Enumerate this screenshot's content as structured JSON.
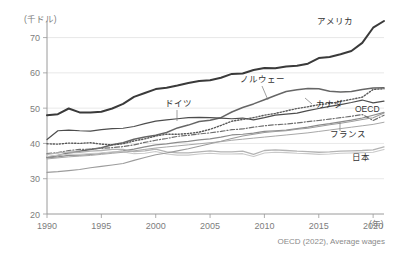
{
  "chart_data": {
    "type": "line",
    "title": "",
    "subtitle": "",
    "xlabel": "(年)",
    "ylabel": "(千ドル)",
    "xlim": [
      1990,
      2021
    ],
    "ylim": [
      20,
      73
    ],
    "grid": "horizontal",
    "legend_position": "inline-labels",
    "source": "OECD (2022), Average wages",
    "x": [
      1990,
      1991,
      1992,
      1993,
      1994,
      1995,
      1996,
      1997,
      1998,
      1999,
      2000,
      2001,
      2002,
      2003,
      2004,
      2005,
      2006,
      2007,
      2008,
      2009,
      2010,
      2011,
      2012,
      2013,
      2014,
      2015,
      2016,
      2017,
      2018,
      2019,
      2020,
      2021
    ],
    "xticks": [
      1990,
      1995,
      2000,
      2005,
      2010,
      2015,
      2020
    ],
    "yticks": [
      20,
      30,
      40,
      50,
      60,
      70
    ],
    "series": [
      {
        "name": "アメリカ",
        "label": "アメリカ",
        "color": "#3a3a3a",
        "style": "solid",
        "width": 2.0,
        "values": [
          48.0,
          48.3,
          49.9,
          48.8,
          48.8,
          49.0,
          49.9,
          51.2,
          53.2,
          54.3,
          55.4,
          55.8,
          56.4,
          57.1,
          57.7,
          57.9,
          58.6,
          59.7,
          59.8,
          60.8,
          61.4,
          61.3,
          61.8,
          62.0,
          62.6,
          64.2,
          64.5,
          65.3,
          66.2,
          68.5,
          72.8,
          74.7
        ]
      },
      {
        "name": "ノルウェー",
        "label": "ノルウェー",
        "color": "#666666",
        "style": "solid",
        "width": 1.5,
        "values": [
          36.1,
          36.6,
          37.3,
          37.8,
          38.3,
          38.8,
          39.6,
          40.2,
          41.2,
          41.8,
          42.3,
          43.1,
          44.4,
          45.2,
          46.2,
          46.6,
          47.3,
          48.9,
          50.2,
          51.2,
          52.4,
          53.6,
          54.7,
          55.2,
          55.6,
          55.5,
          54.8,
          54.6,
          54.7,
          55.3,
          55.7,
          55.8
        ]
      },
      {
        "name": "ドイツ",
        "label": "ドイツ",
        "color": "#4d4d4d",
        "style": "solid",
        "width": 1.2,
        "values": [
          41.1,
          43.6,
          43.8,
          43.6,
          43.5,
          43.9,
          44.2,
          44.3,
          44.8,
          45.6,
          46.3,
          46.7,
          47.0,
          47.3,
          47.4,
          47.3,
          47.2,
          47.0,
          47.2,
          46.7,
          47.3,
          48.0,
          48.3,
          48.6,
          49.3,
          49.9,
          50.5,
          51.0,
          51.6,
          52.3,
          51.5,
          52.0
        ]
      },
      {
        "name": "カナダ",
        "label": "カナダ",
        "color": "#595959",
        "style": "dotted",
        "width": 1.4,
        "values": [
          39.9,
          39.8,
          40.1,
          40.0,
          40.2,
          39.8,
          39.6,
          39.9,
          40.7,
          41.3,
          42.1,
          42.6,
          42.6,
          42.8,
          43.2,
          44.0,
          45.1,
          46.3,
          46.8,
          47.3,
          48.0,
          48.5,
          49.2,
          49.9,
          50.4,
          51.0,
          51.3,
          51.9,
          52.5,
          53.1,
          55.3,
          55.5
        ]
      },
      {
        "name": "OECD",
        "label": "OECD",
        "color": "#8c8c8c",
        "style": "solid",
        "width": 1.2,
        "values": [
          35.9,
          36.2,
          36.6,
          36.7,
          36.9,
          37.2,
          37.5,
          37.9,
          38.4,
          39.0,
          39.6,
          39.9,
          40.3,
          40.6,
          41.0,
          41.3,
          41.8,
          42.4,
          42.6,
          42.9,
          43.4,
          43.6,
          43.8,
          44.2,
          44.6,
          45.2,
          45.6,
          46.1,
          46.6,
          47.2,
          48.0,
          48.8
        ]
      },
      {
        "name": "フランス",
        "label": "フランス",
        "color": "#6e6e6e",
        "style": "dashdot",
        "width": 1.2,
        "values": [
          37.1,
          37.4,
          38.0,
          38.3,
          38.4,
          38.6,
          38.8,
          39.1,
          39.6,
          40.3,
          40.9,
          41.4,
          42.0,
          42.3,
          42.7,
          43.0,
          43.4,
          43.9,
          44.1,
          44.6,
          45.0,
          45.3,
          45.5,
          45.8,
          46.2,
          46.5,
          46.9,
          47.3,
          47.7,
          48.2,
          46.5,
          48.0
        ]
      },
      {
        "name": "日本",
        "label": "日本",
        "color": "#b3b3b3",
        "style": "solid",
        "width": 1.3,
        "values": [
          36.9,
          37.3,
          37.6,
          37.5,
          37.8,
          38.0,
          38.3,
          38.3,
          37.7,
          37.9,
          38.4,
          37.6,
          37.3,
          37.3,
          37.6,
          37.9,
          37.6,
          37.6,
          37.8,
          36.9,
          38.0,
          38.2,
          38.0,
          37.8,
          37.7,
          37.5,
          37.6,
          37.8,
          37.9,
          38.0,
          38.2,
          39.0
        ]
      },
      {
        "name": "日本-下",
        "label": "",
        "color": "#c9c9c9",
        "style": "solid",
        "width": 1.1,
        "values": [
          36.3,
          36.7,
          37.0,
          36.9,
          37.1,
          37.3,
          37.6,
          37.6,
          37.1,
          37.2,
          37.7,
          37.0,
          36.7,
          36.7,
          37.0,
          37.2,
          37.0,
          37.0,
          37.1,
          36.3,
          37.3,
          37.5,
          37.4,
          37.2,
          37.1,
          36.9,
          37.0,
          37.2,
          37.3,
          37.4,
          37.5,
          38.3
        ]
      },
      {
        "name": "イタリア",
        "label": "",
        "color": "#9c9c9c",
        "style": "solid",
        "width": 1.1,
        "values": [
          31.8,
          32.0,
          32.3,
          32.6,
          33.1,
          33.5,
          33.9,
          34.3,
          35.2,
          36.0,
          36.8,
          37.3,
          37.9,
          38.5,
          39.2,
          39.9,
          40.6,
          41.4,
          42.1,
          42.6,
          43.1,
          43.4,
          43.6,
          44.0,
          44.3,
          44.8,
          45.3,
          45.7,
          46.2,
          46.8,
          47.3,
          48.6
        ]
      },
      {
        "name": "イギリス",
        "label": "",
        "color": "#a8a8a8",
        "style": "solid",
        "width": 1.0,
        "values": [
          35.6,
          35.9,
          36.2,
          36.4,
          36.6,
          36.9,
          37.2,
          37.5,
          37.9,
          38.3,
          38.7,
          39.0,
          39.3,
          39.6,
          39.9,
          40.2,
          40.5,
          40.9,
          41.2,
          41.5,
          41.8,
          42.1,
          42.4,
          42.7,
          43.0,
          43.4,
          43.8,
          44.2,
          44.6,
          45.0,
          45.4,
          46.0
        ]
      }
    ],
    "annotations": [
      {
        "name": "america",
        "text": "アメリカ",
        "x_px": 317,
        "y_px": 24,
        "anchor": "start",
        "leader": null
      },
      {
        "name": "norway",
        "text": "ノルウェー",
        "x_px": 240,
        "y_px": 82,
        "anchor": "start",
        "leader": {
          "x1": 262,
          "y1": 86,
          "x2": 268,
          "y2": 100
        }
      },
      {
        "name": "germany",
        "text": "ドイツ",
        "x_px": 165,
        "y_px": 106,
        "anchor": "start",
        "leader": {
          "x1": 177,
          "y1": 110,
          "x2": 177,
          "y2": 121
        }
      },
      {
        "name": "canada",
        "text": "カナダ",
        "x_px": 316,
        "y_px": 107,
        "anchor": "start",
        "leader": {
          "x1": 312,
          "y1": 104,
          "x2": 305,
          "y2": 98
        }
      },
      {
        "name": "oecd",
        "text": "OECD",
        "x_px": 355,
        "y_px": 112,
        "anchor": "start",
        "leader": null
      },
      {
        "name": "france",
        "text": "フランス",
        "x_px": 330,
        "y_px": 137,
        "anchor": "start",
        "leader": {
          "x1": 340,
          "y1": 131,
          "x2": 340,
          "y2": 122
        }
      },
      {
        "name": "japan",
        "text": "日本",
        "x_px": 352,
        "y_px": 160,
        "anchor": "start",
        "leader": null
      }
    ]
  }
}
